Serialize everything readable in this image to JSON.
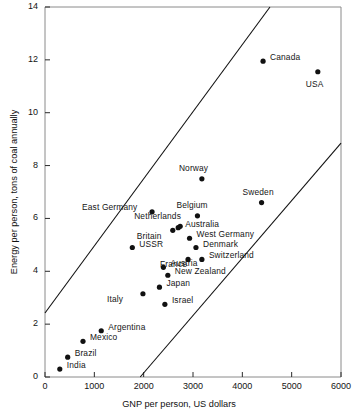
{
  "chart_data": {
    "type": "scatter",
    "title": "",
    "xlabel": "GNP per person, US dollars",
    "ylabel": "Energy per person, tons of coal annually",
    "xlim": [
      0,
      6000
    ],
    "ylim": [
      0,
      14
    ],
    "xticks": [
      0,
      1000,
      2000,
      3000,
      4000,
      5000,
      6000
    ],
    "yticks": [
      0,
      2,
      4,
      6,
      8,
      10,
      12,
      14
    ],
    "xtick_labels": [
      "0",
      "1000",
      "2000",
      "3000",
      "4000",
      "5000",
      "6000"
    ],
    "ytick_labels": [
      "0",
      "2",
      "4",
      "6",
      "8",
      "10",
      "12",
      "14"
    ],
    "grid": false,
    "legend": "none",
    "point_color": "#111111",
    "line_color": "#111111",
    "points": [
      {
        "name": "India",
        "x": 300,
        "y": 0.3,
        "label_dx": 7,
        "label_dy": -4
      },
      {
        "name": "Brazil",
        "x": 460,
        "y": 0.75,
        "label_dx": 7,
        "label_dy": -4
      },
      {
        "name": "Mexico",
        "x": 770,
        "y": 1.35,
        "label_dx": 7,
        "label_dy": -4
      },
      {
        "name": "Argentina",
        "x": 1140,
        "y": 1.75,
        "label_dx": 7,
        "label_dy": -4
      },
      {
        "name": "Italy",
        "x": 1985,
        "y": 3.15,
        "label_dx": -36,
        "label_dy": 5
      },
      {
        "name": "Israel",
        "x": 2430,
        "y": 2.75,
        "label_dx": 7,
        "label_dy": -4
      },
      {
        "name": "Japan",
        "x": 2320,
        "y": 3.4,
        "label_dx": 7,
        "label_dy": -4
      },
      {
        "name": "New Zealand",
        "x": 2490,
        "y": 3.85,
        "label_dx": 7,
        "label_dy": -4
      },
      {
        "name": "Austria",
        "x": 2400,
        "y": 4.15,
        "label_dx": 7,
        "label_dy": -4
      },
      {
        "name": "USSR",
        "x": 1770,
        "y": 4.9,
        "label_dx": 7,
        "label_dy": -4
      },
      {
        "name": "France",
        "x": 2900,
        "y": 4.45,
        "label_dx": -28,
        "label_dy": 5
      },
      {
        "name": "Switzerland",
        "x": 3180,
        "y": 4.45,
        "label_dx": 7,
        "label_dy": -4
      },
      {
        "name": "Denmark",
        "x": 3060,
        "y": 4.9,
        "label_dx": 7,
        "label_dy": -4
      },
      {
        "name": "West Germany",
        "x": 2930,
        "y": 5.25,
        "label_dx": 7,
        "label_dy": -4
      },
      {
        "name": "Britain",
        "x": 2590,
        "y": 5.55,
        "label_dx": -36,
        "label_dy": 6
      },
      {
        "name": "Australia",
        "x": 2700,
        "y": 5.65,
        "label_dx": 7,
        "label_dy": -4
      },
      {
        "name": "Netherlands",
        "x": 2740,
        "y": 5.7,
        "label_dx": -46,
        "label_dy": -10
      },
      {
        "name": "Belgium",
        "x": 3090,
        "y": 6.1,
        "label_dx": -21,
        "label_dy": -11
      },
      {
        "name": "East Germany",
        "x": 2170,
        "y": 6.25,
        "label_dx": -70,
        "label_dy": -5
      },
      {
        "name": "Sweden",
        "x": 4390,
        "y": 6.6,
        "label_dx": -19,
        "label_dy": -11
      },
      {
        "name": "Norway",
        "x": 3180,
        "y": 7.5,
        "label_dx": -23,
        "label_dy": -11
      },
      {
        "name": "Canada",
        "x": 4420,
        "y": 11.95,
        "label_dx": 7,
        "label_dy": -4
      },
      {
        "name": "USA",
        "x": 5530,
        "y": 11.55,
        "label_dx": -12,
        "label_dy": 12
      }
    ],
    "reference_lines": [
      {
        "name": "upper-band-line",
        "x1": 0,
        "y1": 2.42,
        "x2": 4560,
        "y2": 14.0
      },
      {
        "name": "lower-band-line",
        "x1": 1930,
        "y1": 0.0,
        "x2": 6000,
        "y2": 8.85
      }
    ]
  }
}
